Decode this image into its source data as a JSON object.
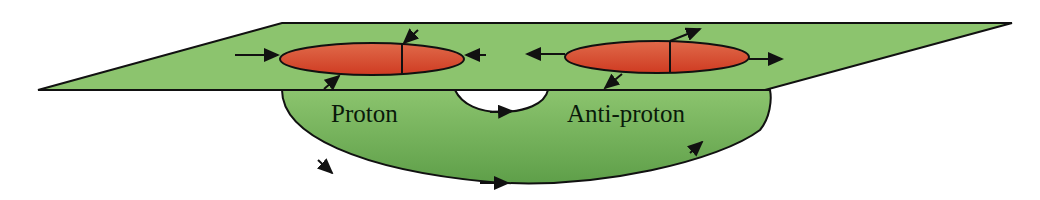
{
  "diagram": {
    "labels": {
      "proton": "Proton",
      "antiproton": "Anti-proton"
    },
    "colors": {
      "plane_fill": "#8cc46e",
      "loop_fill_top": "#8cc46e",
      "loop_fill_bottom": "#5fa04a",
      "bunch_fill": "#d9452a",
      "bunch_highlight": "#e8704f",
      "stroke": "#111111",
      "hole": "#ffffff"
    },
    "elements": {
      "plane": "horizontal-plane",
      "loop": "beam-loop",
      "bunches": [
        "proton-bunch",
        "antiproton-bunch"
      ],
      "proton_bunch_forces": [
        "inward-left",
        "inward-right",
        "inward-top",
        "inward-bottom"
      ],
      "antiproton_bunch_forces": [
        "outward-left",
        "outward-right",
        "outward-top",
        "outward-bottom"
      ]
    }
  }
}
